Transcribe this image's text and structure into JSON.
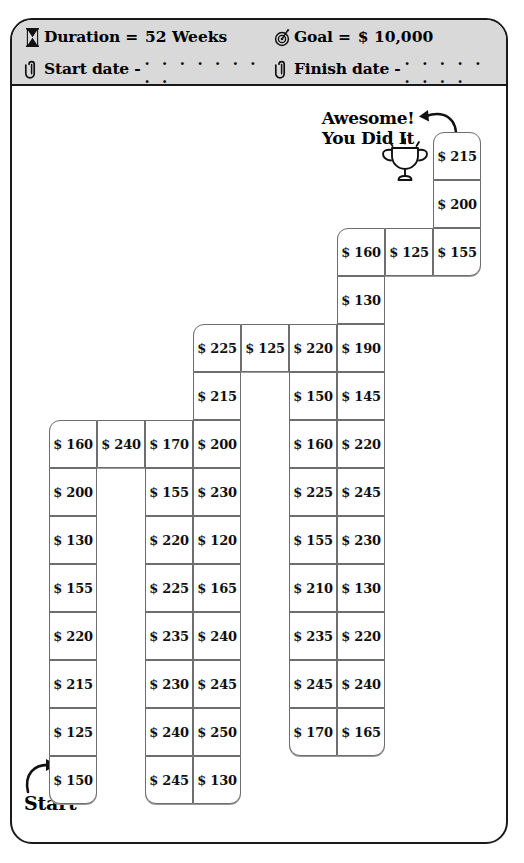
{
  "header": {
    "duration_icon": "hourglass-icon",
    "duration_label": "Duration  =",
    "duration_value": "52 Weeks",
    "goal_icon": "target-icon",
    "goal_label": "Goal  =",
    "goal_value": "$ 10,000",
    "start_date_icon": "paperclip-icon",
    "start_date_label": "Start date -",
    "start_date_dots": ". . . . . . . . .",
    "finish_date_icon": "paperclip-icon",
    "finish_date_label": "Finish date -",
    "finish_date_dots": ". . . . . . . . ."
  },
  "board": {
    "start_label": "Start",
    "congrats_line1": "Awesome!",
    "congrats_line2": "You Did It",
    "trophy_icon": "trophy-icon",
    "currency": "$",
    "columns": [
      {
        "name": "column-1",
        "x": 37,
        "y_start": 334,
        "values": [
          "$ 160",
          "$ 200",
          "$ 130",
          "$ 155",
          "$ 220",
          "$ 215",
          "$ 125",
          "$ 150"
        ]
      },
      {
        "name": "column-2",
        "x": 85,
        "y_start": 334,
        "values": [
          "$ 240"
        ]
      },
      {
        "name": "column-3",
        "x": 133,
        "y_start": 334,
        "values": [
          "$ 170",
          "$ 155",
          "$ 220",
          "$ 225",
          "$ 235",
          "$ 230",
          "$ 240",
          "$ 245"
        ]
      },
      {
        "name": "column-4",
        "x": 181,
        "y_start": 238,
        "values": [
          "$ 225",
          "$ 215",
          "$ 200",
          "$ 230",
          "$ 120",
          "$ 165",
          "$ 240",
          "$ 245",
          "$ 250",
          "$ 130"
        ]
      },
      {
        "name": "column-5",
        "x": 229,
        "y_start": 238,
        "values": [
          "$ 125"
        ]
      },
      {
        "name": "column-6",
        "x": 277,
        "y_start": 238,
        "values": [
          "$ 220",
          "$ 150",
          "$ 160",
          "$ 225",
          "$ 155",
          "$ 210",
          "$ 235",
          "$ 245",
          "$ 170"
        ]
      },
      {
        "name": "column-7",
        "x": 325,
        "y_start": 142,
        "values": [
          "$ 160",
          "$ 130",
          "$ 190",
          "$ 145",
          "$ 220",
          "$ 245",
          "$ 230",
          "$ 130",
          "$ 220",
          "$ 240",
          "$ 165"
        ]
      },
      {
        "name": "column-8",
        "x": 373,
        "y_start": 142,
        "values": [
          "$ 125"
        ]
      },
      {
        "name": "column-9",
        "x": 421,
        "y_start": 46,
        "values": [
          "$ 215",
          "$ 200",
          "$ 155"
        ]
      }
    ]
  },
  "chart_data": {
    "type": "table",
    "goal_total": "$ 10,000",
    "duration_weeks": 52,
    "note": "Board of weekly savings amounts, read from Start (bottom-left) to the trophy (top-right).",
    "path_values": [
      150,
      125,
      215,
      220,
      155,
      130,
      200,
      160,
      240,
      170,
      155,
      220,
      225,
      235,
      230,
      240,
      245,
      130,
      250,
      245,
      240,
      165,
      120,
      230,
      200,
      215,
      225,
      125,
      220,
      150,
      160,
      225,
      155,
      210,
      235,
      245,
      170,
      165,
      240,
      220,
      130,
      230,
      245,
      220,
      145,
      190,
      130,
      160,
      125,
      155,
      200,
      215
    ]
  }
}
